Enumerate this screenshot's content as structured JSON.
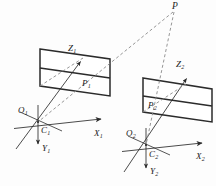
{
  "figure": {
    "background_color": "#fdfdfd",
    "line_color": "#2b2b2b",
    "dashed_color": "#8a8a8a"
  },
  "labels": {
    "world_point": {
      "base": "P",
      "sub": ""
    },
    "image_point_left": {
      "base": "P",
      "sub": "1"
    },
    "image_point_right": {
      "base": "P",
      "sub": "2"
    },
    "origin_left": {
      "base": "O",
      "sub": "1"
    },
    "origin_right": {
      "base": "O",
      "sub": "2"
    },
    "center_left": {
      "base": "C",
      "sub": "1"
    },
    "center_right": {
      "base": "C",
      "sub": "2"
    },
    "x_axis_left": {
      "base": "X",
      "sub": "1"
    },
    "x_axis_right": {
      "base": "X",
      "sub": "2"
    },
    "y_axis_left": {
      "base": "Y",
      "sub": "1"
    },
    "y_axis_right": {
      "base": "Y",
      "sub": "2"
    },
    "z_axis_left": {
      "base": "Z",
      "sub": "1"
    },
    "z_axis_right": {
      "base": "Z",
      "sub": "2"
    }
  },
  "geometry": {
    "left_plane": "40,49 110,59 110,96 40,86",
    "left_plane_divider": "40,68 110,78",
    "right_plane": "143,78 212,89 212,122 143,112",
    "right_plane_divider": "143,96 212,106",
    "left_x_axis": "14,128 105,118",
    "left_y_axis": "38,104 38,150",
    "left_z_axis": "16,149 84,57",
    "left_cross_aux": "20,113 60,130",
    "right_x_axis": "122,151 206,142",
    "right_y_axis": "146,128 146,174",
    "right_z_axis": "124,172 190,74",
    "right_cross_aux": "128,137 168,154",
    "ray_left": "174,11 38,122",
    "ray_right": "174,11 146,145",
    "ray_left_lower": "40,86 84,57"
  }
}
